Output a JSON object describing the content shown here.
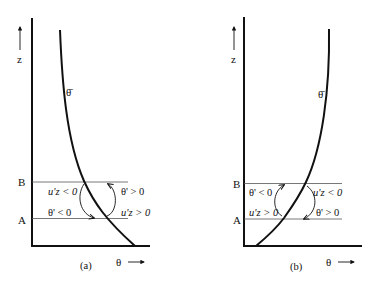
{
  "figure": {
    "panels": [
      {
        "id": "a",
        "caption": "(a)",
        "x_axis_label": "θ",
        "x_axis_arrow": "→",
        "y_axis_label": "z",
        "curve_label": "θ̄",
        "levels": {
          "upper": "B",
          "lower": "A"
        },
        "annotations": {
          "upper_left": "u'z < 0",
          "upper_right": "θ' > 0",
          "lower_left": "θ' < 0",
          "lower_right": "u'z > 0"
        }
      },
      {
        "id": "b",
        "caption": "(b)",
        "x_axis_label": "θ",
        "x_axis_arrow": "→",
        "y_axis_label": "z",
        "curve_label": "θ̄",
        "levels": {
          "upper": "B",
          "lower": "A"
        },
        "annotations": {
          "upper_left": "θ' < 0",
          "upper_right": "u'z < 0",
          "lower_left": "u'z > 0",
          "lower_right": "θ' > 0"
        }
      }
    ]
  },
  "colors": {
    "ink": "#111111",
    "thin_line": "#444444",
    "background": "#ffffff"
  }
}
